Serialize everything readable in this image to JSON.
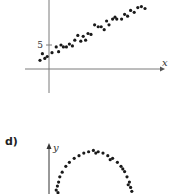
{
  "chart_data": [
    {
      "type": "scatter",
      "panel_label": "",
      "xlabel": "x",
      "ylabel": "",
      "y_tick_labels": [
        "5"
      ],
      "trend": "positive linear",
      "xlim": [
        -2,
        20
      ],
      "ylim": [
        -4,
        16
      ],
      "points": [
        [
          -1.5,
          1.8
        ],
        [
          -1.1,
          3.2
        ],
        [
          -0.7,
          2.2
        ],
        [
          -0.3,
          2.6
        ],
        [
          0.5,
          3.4
        ],
        [
          1.2,
          4.6
        ],
        [
          1.6,
          3.6
        ],
        [
          2.0,
          5.0
        ],
        [
          2.4,
          4.6
        ],
        [
          2.9,
          4.6
        ],
        [
          3.4,
          5.2
        ],
        [
          3.9,
          4.8
        ],
        [
          4.3,
          6.0
        ],
        [
          4.8,
          7.0
        ],
        [
          5.3,
          5.8
        ],
        [
          5.7,
          6.8
        ],
        [
          6.1,
          6.0
        ],
        [
          6.5,
          7.4
        ],
        [
          7.0,
          7.2
        ],
        [
          7.6,
          9.2
        ],
        [
          8.2,
          8.8
        ],
        [
          8.7,
          8.8
        ],
        [
          9.2,
          8.2
        ],
        [
          9.6,
          10.0
        ],
        [
          10.0,
          9.2
        ],
        [
          10.6,
          10.4
        ],
        [
          11.0,
          10.8
        ],
        [
          11.3,
          10.4
        ],
        [
          12.1,
          10.4
        ],
        [
          12.6,
          11.4
        ],
        [
          13.1,
          11.0
        ],
        [
          13.6,
          12.2
        ],
        [
          14.2,
          11.8
        ],
        [
          14.8,
          12.8
        ],
        [
          15.4,
          13.0
        ],
        [
          16.0,
          12.6
        ]
      ]
    },
    {
      "type": "scatter",
      "panel_label": "d)",
      "xlabel": "",
      "ylabel": "y",
      "trend": "inverted U (arc)",
      "xlim": [
        -2,
        20
      ],
      "ylim": [
        0,
        12
      ],
      "points": [
        [
          1.2,
          0.6
        ],
        [
          1.4,
          1.2
        ],
        [
          1.6,
          1.8
        ],
        [
          1.8,
          2.6
        ],
        [
          2.2,
          3.3
        ],
        [
          2.8,
          4.2
        ],
        [
          3.4,
          4.8
        ],
        [
          4.2,
          5.4
        ],
        [
          5.0,
          5.8
        ],
        [
          5.8,
          6.2
        ],
        [
          6.6,
          6.4
        ],
        [
          7.4,
          6.6
        ],
        [
          8.2,
          6.4
        ],
        [
          9.0,
          6.2
        ],
        [
          9.8,
          5.8
        ],
        [
          10.6,
          5.4
        ],
        [
          11.4,
          4.8
        ],
        [
          12.0,
          4.2
        ],
        [
          12.6,
          3.4
        ],
        [
          13.0,
          2.6
        ],
        [
          13.4,
          1.8
        ],
        [
          13.6,
          1.0
        ],
        [
          13.8,
          0.4
        ],
        [
          7.8,
          6.2
        ],
        [
          10.2,
          5.2
        ],
        [
          12.3,
          3.8
        ],
        [
          1.5,
          0.2
        ],
        [
          13.2,
          1.4
        ]
      ]
    }
  ]
}
